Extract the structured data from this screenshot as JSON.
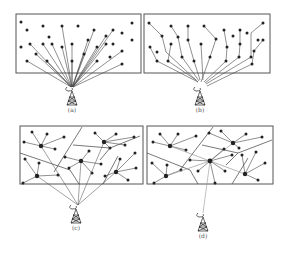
{
  "figure": {
    "colors": {
      "ink": "#222222",
      "frame": "#555555",
      "line": "#444444",
      "faint": "#999999",
      "background": "#ffffff"
    },
    "panels": [
      {
        "id": "a",
        "label": "(a)",
        "description": "Every node connects directly to the base-station tower (single-hop star)",
        "box": [
          16,
          14,
          125,
          59
        ],
        "tower": [
          72,
          97
        ],
        "nodes": [
          [
            21,
            22
          ],
          [
            27,
            30
          ],
          [
            43,
            26
          ],
          [
            62,
            26
          ],
          [
            78,
            26
          ],
          [
            94,
            30
          ],
          [
            132,
            23
          ],
          [
            49,
            37
          ],
          [
            88,
            40
          ],
          [
            106,
            36
          ],
          [
            113,
            30
          ],
          [
            122,
            33
          ],
          [
            132,
            40
          ],
          [
            21,
            47
          ],
          [
            30,
            44
          ],
          [
            43,
            44
          ],
          [
            52,
            44
          ],
          [
            62,
            47
          ],
          [
            72,
            44
          ],
          [
            97,
            47
          ],
          [
            106,
            44
          ],
          [
            113,
            44
          ],
          [
            122,
            51
          ],
          [
            36,
            54
          ],
          [
            72,
            61
          ],
          [
            84,
            54
          ],
          [
            97,
            61
          ],
          [
            110,
            57
          ],
          [
            27,
            61
          ],
          [
            47,
            61
          ],
          [
            122,
            64
          ]
        ],
        "links_to_tower": [
          [
            62,
            26
          ],
          [
            94,
            30
          ],
          [
            106,
            36
          ],
          [
            113,
            30
          ],
          [
            88,
            40
          ],
          [
            43,
            44
          ],
          [
            52,
            44
          ],
          [
            62,
            47
          ],
          [
            72,
            44
          ],
          [
            97,
            47
          ],
          [
            106,
            44
          ],
          [
            122,
            51
          ],
          [
            36,
            54
          ],
          [
            84,
            54
          ],
          [
            72,
            61
          ],
          [
            97,
            61
          ],
          [
            27,
            61
          ],
          [
            47,
            61
          ],
          [
            122,
            64
          ],
          [
            30,
            44
          ]
        ]
      },
      {
        "id": "b",
        "label": "(b)",
        "description": "Multi-hop chains: nodes relay toward the tower",
        "box": [
          144,
          14,
          126,
          59
        ],
        "tower": [
          200,
          97
        ],
        "nodes": [
          [
            149,
            23
          ],
          [
            162,
            36
          ],
          [
            150,
            47
          ],
          [
            157,
            52
          ],
          [
            171,
            26
          ],
          [
            178,
            37
          ],
          [
            171,
            44
          ],
          [
            188,
            26
          ],
          [
            188,
            40
          ],
          [
            204,
            26
          ],
          [
            216,
            39
          ],
          [
            240,
            30
          ],
          [
            263,
            23
          ],
          [
            247,
            33
          ],
          [
            258,
            40
          ],
          [
            224,
            30
          ],
          [
            233,
            36
          ],
          [
            157,
            61
          ],
          [
            168,
            61
          ],
          [
            182,
            57
          ],
          [
            194,
            61
          ],
          [
            201,
            44
          ],
          [
            227,
            47
          ],
          [
            254,
            51
          ],
          [
            263,
            40
          ],
          [
            210,
            57
          ],
          [
            239,
            57
          ],
          [
            251,
            57
          ],
          [
            252,
            64
          ],
          [
            226,
            61
          ],
          [
            240,
            44
          ]
        ],
        "chains": [
          [
            [
              149,
              23
            ],
            [
              162,
              36
            ],
            [
              166,
              52
            ],
            [
              198,
              82
            ]
          ],
          [
            [
              150,
              47
            ],
            [
              157,
              61
            ],
            [
              198,
              82
            ]
          ],
          [
            [
              171,
              26
            ],
            [
              178,
              37
            ],
            [
              182,
              57
            ],
            [
              199,
              81
            ]
          ],
          [
            [
              171,
              44
            ],
            [
              168,
              61
            ],
            [
              196,
              80
            ]
          ],
          [
            [
              188,
              26
            ],
            [
              188,
              40
            ],
            [
              194,
              61
            ],
            [
              200,
              80
            ]
          ],
          [
            [
              204,
              26
            ],
            [
              216,
              39
            ],
            [
              210,
              57
            ],
            [
              201,
              82
            ]
          ],
          [
            [
              201,
              44
            ],
            [
              203,
              80
            ]
          ],
          [
            [
              224,
              30
            ],
            [
              227,
              47
            ],
            [
              226,
              61
            ],
            [
              204,
              82
            ]
          ],
          [
            [
              240,
              30
            ],
            [
              240,
              44
            ],
            [
              239,
              57
            ],
            [
              205,
              83
            ]
          ],
          [
            [
              263,
              23
            ],
            [
              251,
              33
            ],
            [
              251,
              57
            ],
            [
              206,
              84
            ]
          ],
          [
            [
              263,
              40
            ],
            [
              254,
              51
            ],
            [
              252,
              64
            ],
            [
              207,
              86
            ]
          ]
        ]
      },
      {
        "id": "c",
        "label": "(c)",
        "description": "Clustered: member nodes connect to cluster heads which link to the tower",
        "box": [
          20,
          126,
          123,
          58
        ],
        "tower": [
          76,
          215
        ],
        "cluster_heads": [
          [
            41,
            146
          ],
          [
            81,
            161
          ],
          [
            104,
            142
          ],
          [
            37,
            176
          ],
          [
            116,
            172
          ]
        ],
        "members": [
          [
            [
              32,
              132
            ],
            [
              47,
              134
            ],
            [
              64,
              137
            ],
            [
              24,
              142
            ],
            [
              55,
              149
            ]
          ],
          [
            [
              65,
              157
            ],
            [
              89,
              151
            ],
            [
              69,
              168
            ],
            [
              92,
              173
            ],
            [
              101,
              164
            ]
          ],
          [
            [
              95,
              133
            ],
            [
              116,
              134
            ],
            [
              134,
              137
            ],
            [
              125,
              145
            ],
            [
              110,
              148
            ]
          ],
          [
            [
              25,
              159
            ],
            [
              39,
              163
            ],
            [
              23,
              183
            ],
            [
              58,
              175
            ]
          ],
          [
            [
              120,
              159
            ],
            [
              135,
              153
            ],
            [
              136,
              168
            ],
            [
              128,
              180
            ],
            [
              105,
              176
            ]
          ]
        ],
        "boundaries": [
          [
            [
              20,
              153
            ],
            [
              70,
              170
            ],
            [
              79,
              184
            ]
          ],
          [
            [
              54,
              172
            ],
            [
              82,
              127
            ]
          ],
          [
            [
              73,
              145
            ],
            [
              110,
              148
            ],
            [
              140,
              136
            ]
          ],
          [
            [
              110,
              148
            ],
            [
              100,
              160
            ]
          ],
          [
            [
              118,
              156
            ],
            [
              103,
              184
            ]
          ]
        ],
        "links_to_tower": [
          [
            41,
            146
          ],
          [
            81,
            161
          ],
          [
            104,
            142
          ],
          [
            37,
            176
          ],
          [
            116,
            172
          ]
        ]
      },
      {
        "id": "d",
        "label": "(d)",
        "description": "Hierarchical: cluster heads forward to a central node which links to the tower",
        "box": [
          147,
          126,
          126,
          58
        ],
        "tower": [
          203,
          223
        ],
        "central_head": [
          210,
          161
        ],
        "cluster_heads": [
          [
            170,
            146
          ],
          [
            233,
            143
          ],
          [
            166,
            176
          ],
          [
            245,
            174
          ]
        ],
        "members": [
          [
            [
              160,
              134
            ],
            [
              178,
              134
            ],
            [
              196,
              136
            ],
            [
              153,
              142
            ],
            [
              186,
              150
            ]
          ],
          [
            [
              209,
              133
            ],
            [
              221,
              131
            ],
            [
              246,
              134
            ],
            [
              262,
              137
            ],
            [
              239,
              148
            ]
          ],
          [
            [
              152,
              163
            ],
            [
              167,
              165
            ],
            [
              154,
              183
            ],
            [
              181,
              170
            ]
          ],
          [
            [
              256,
              152
            ],
            [
              265,
              163
            ],
            [
              258,
              180
            ],
            [
              242,
              155
            ]
          ],
          [
            [
              190,
              160
            ],
            [
              198,
              171
            ],
            [
              224,
              149
            ],
            [
              232,
              155
            ],
            [
              225,
              171
            ],
            [
              215,
              183
            ]
          ]
        ],
        "boundaries": [
          [
            [
              147,
              153
            ],
            [
              190,
              170
            ],
            [
              198,
              184
            ]
          ],
          [
            [
              180,
              170
            ],
            [
              213,
              127
            ]
          ],
          [
            [
              202,
              145
            ],
            [
              238,
              153
            ],
            [
              272,
              140
            ]
          ],
          [
            [
              238,
              153
            ],
            [
              226,
              165
            ]
          ],
          [
            [
              248,
              158
            ],
            [
              232,
              184
            ]
          ]
        ]
      }
    ]
  }
}
